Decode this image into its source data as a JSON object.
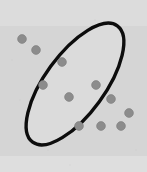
{
  "figure": {
    "width": 147,
    "height": 172,
    "background_color": "#d9d9d9",
    "watermark": {
      "text": "",
      "color": "#cccccc"
    }
  },
  "chart_data": {
    "type": "scatter",
    "title": "",
    "subtitle": "",
    "xlabel": "",
    "ylabel": "",
    "xlim": [
      0,
      147
    ],
    "ylim": [
      0,
      172
    ],
    "grid": false,
    "legend": "none",
    "axes_visible": false,
    "tick_labels_x": [],
    "tick_labels_y": [],
    "annotations": [
      {
        "name": "cluster-boundary-ellipse",
        "shape": "ellipse",
        "cx": 75,
        "cy": 84,
        "rx": 72,
        "ry": 30,
        "rotation_deg": -54,
        "stroke_color": "#0d0d0d",
        "stroke_width": 3.4,
        "fill_color": "#dbdbdb"
      }
    ],
    "series": [
      {
        "name": "points",
        "marker": "circle",
        "marker_color": "#8c8c8c",
        "marker_radius": 4.4,
        "count": 11,
        "points": [
          {
            "x": 22,
            "y": 39
          },
          {
            "x": 36,
            "y": 50
          },
          {
            "x": 62,
            "y": 62
          },
          {
            "x": 43,
            "y": 85
          },
          {
            "x": 96,
            "y": 85
          },
          {
            "x": 69,
            "y": 97
          },
          {
            "x": 111,
            "y": 99
          },
          {
            "x": 79,
            "y": 126
          },
          {
            "x": 101,
            "y": 126
          },
          {
            "x": 121,
            "y": 126
          },
          {
            "x": 129,
            "y": 113
          }
        ]
      }
    ]
  }
}
